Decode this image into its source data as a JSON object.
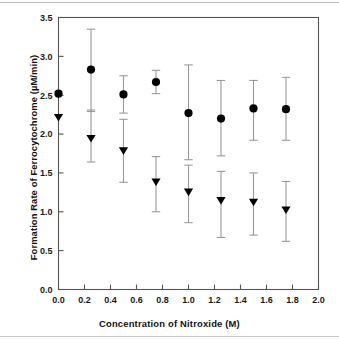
{
  "figure": {
    "background_color": "#ffffff",
    "frame_color": "#555555",
    "marker_color": "#000000",
    "errorbar_color": "#9a9a9a"
  },
  "chart_data": {
    "type": "scatter",
    "title": "",
    "xlabel": "Concentration of  Nitroxide  (M)",
    "ylabel": "Formation Rate of Ferrocytochrome (µM/min)",
    "xlim": [
      0.0,
      2.0
    ],
    "ylim": [
      0.0,
      3.5
    ],
    "xticks": [
      0.0,
      0.2,
      0.4,
      0.6,
      0.8,
      1.0,
      1.2,
      1.4,
      1.6,
      1.8,
      2.0
    ],
    "xtick_labels": [
      "0.0",
      "0.2",
      "0.4",
      "0.6",
      "0.8",
      "1.0",
      "1.2",
      "1.4",
      "1.6",
      "1.8",
      "2.0"
    ],
    "yticks": [
      0.0,
      0.5,
      1.0,
      1.5,
      2.0,
      2.5,
      3.0,
      3.5
    ],
    "ytick_labels": [
      "0.0",
      "0.5",
      "1.0",
      "1.5",
      "2.0",
      "2.5",
      "3.0",
      "3.5"
    ],
    "grid": false,
    "legend": false,
    "x": [
      0.0,
      0.25,
      0.5,
      0.75,
      1.0,
      1.25,
      1.5,
      1.75
    ],
    "series": [
      {
        "name": "circle-series",
        "marker": "circle",
        "values": [
          2.52,
          2.83,
          2.51,
          2.67,
          2.27,
          2.2,
          2.33,
          2.32
        ],
        "err_upper": [
          0.0,
          0.52,
          0.24,
          0.15,
          0.62,
          0.49,
          0.36,
          0.41
        ],
        "err_lower": [
          0.0,
          0.54,
          0.24,
          0.15,
          0.6,
          0.48,
          0.41,
          0.4
        ]
      },
      {
        "name": "triangle-series",
        "marker": "triangle-down",
        "values": [
          2.21,
          1.94,
          1.78,
          1.38,
          1.25,
          1.14,
          1.12,
          1.02
        ],
        "err_upper": [
          0.0,
          0.37,
          0.41,
          0.33,
          0.35,
          0.38,
          0.38,
          0.37
        ],
        "err_lower": [
          0.0,
          0.3,
          0.4,
          0.38,
          0.39,
          0.47,
          0.42,
          0.4
        ]
      }
    ]
  }
}
